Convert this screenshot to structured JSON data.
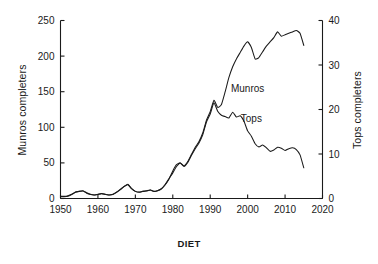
{
  "caption": "DIET",
  "chart_data": {
    "type": "line",
    "title": "",
    "xlabel": "",
    "ylabel": "Munros completers",
    "ylabel_right": "Tops completers",
    "xlim": [
      1950,
      2020
    ],
    "ylim": [
      0,
      250
    ],
    "ylim_right": [
      0,
      40
    ],
    "xticks": [
      1950,
      1960,
      1970,
      1980,
      1990,
      2000,
      2010,
      2020
    ],
    "xticklabels": [
      "1950",
      "1960",
      "1970",
      "1980",
      "1990",
      "2000",
      "2010",
      "2020"
    ],
    "yticks": [
      0,
      50,
      100,
      150,
      200,
      250
    ],
    "yticklabels": [
      "0",
      "50",
      "100",
      "150",
      "200",
      "250"
    ],
    "yticks_right": [
      0,
      10,
      20,
      30,
      40
    ],
    "yticklabels_right": [
      "0",
      "10",
      "20",
      "30",
      "40"
    ],
    "grid": false,
    "legend": "inline-annotations",
    "annotations": [
      {
        "text": "Munros",
        "x": 2000,
        "y": 150
      },
      {
        "text": "Tops",
        "x": 2001,
        "y": 108
      }
    ],
    "x": [
      1950,
      1951,
      1952,
      1953,
      1954,
      1955,
      1956,
      1957,
      1958,
      1959,
      1960,
      1961,
      1962,
      1963,
      1964,
      1965,
      1966,
      1967,
      1968,
      1969,
      1970,
      1971,
      1972,
      1973,
      1974,
      1975,
      1976,
      1977,
      1978,
      1979,
      1980,
      1981,
      1982,
      1983,
      1984,
      1985,
      1986,
      1987,
      1988,
      1989,
      1990,
      1991,
      1992,
      1993,
      1994,
      1995,
      1996,
      1997,
      1998,
      1999,
      2000,
      2001,
      2002,
      2003,
      2004,
      2005,
      2006,
      2007,
      2008,
      2009,
      2010,
      2011,
      2012,
      2013,
      2014,
      2015
    ],
    "series": [
      {
        "name": "Munros",
        "axis": "left",
        "units": "completers",
        "values": [
          3,
          3,
          4,
          6,
          9,
          10,
          11,
          8,
          6,
          5,
          6,
          7,
          6,
          5,
          6,
          9,
          13,
          17,
          20,
          14,
          10,
          9,
          10,
          11,
          12,
          10,
          11,
          14,
          20,
          28,
          36,
          45,
          50,
          46,
          52,
          62,
          72,
          80,
          92,
          110,
          122,
          138,
          128,
          132,
          150,
          170,
          185,
          196,
          205,
          214,
          220,
          212,
          196,
          198,
          206,
          214,
          220,
          226,
          234,
          228,
          230,
          232,
          234,
          236,
          232,
          215
        ]
      },
      {
        "name": "Tops",
        "axis": "right",
        "units": "completers",
        "values": [
          0.4,
          0.4,
          0.5,
          0.9,
          1.4,
          1.6,
          1.7,
          1.2,
          0.9,
          0.8,
          0.9,
          1.1,
          0.9,
          0.8,
          0.9,
          1.4,
          2.0,
          2.7,
          3.1,
          2.2,
          1.6,
          1.4,
          1.6,
          1.7,
          1.9,
          1.6,
          1.8,
          2.2,
          3.1,
          4.4,
          6.2,
          7.6,
          8.0,
          7.2,
          8.1,
          9.7,
          11.2,
          12.5,
          14.3,
          17.2,
          19.0,
          21.5,
          19.6,
          18.7,
          18.4,
          18.1,
          19.4,
          18.3,
          18.6,
          17.4,
          15.2,
          14.0,
          12.3,
          11.6,
          12.0,
          11.4,
          10.6,
          10.9,
          11.5,
          11.3,
          10.8,
          11.2,
          11.4,
          11.0,
          9.8,
          6.9
        ]
      }
    ]
  }
}
